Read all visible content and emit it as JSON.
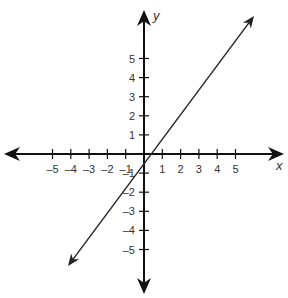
{
  "chart_data": {
    "type": "line",
    "title": "",
    "xlabel": "x",
    "ylabel": "y",
    "xlim": [
      -7,
      7
    ],
    "ylim": [
      -7,
      7
    ],
    "grid": false,
    "x_ticks": [
      -5,
      -4,
      -3,
      -2,
      -1,
      1,
      2,
      3,
      4,
      5
    ],
    "y_ticks": [
      -5,
      -4,
      -3,
      -2,
      -1,
      1,
      2,
      3,
      4,
      5
    ],
    "x_tick_labels": [
      "–5",
      "–4",
      "–3",
      "–2",
      "–1",
      "1",
      "2",
      "3",
      "4",
      "5"
    ],
    "y_tick_labels": [
      "–5",
      "–4",
      "–3",
      "–2",
      "–1",
      "1",
      "2",
      "3",
      "4",
      "5"
    ],
    "series": [
      {
        "name": "line",
        "slope": 1.3333,
        "intercept": -0.3333,
        "points_on_line": [
          [
            -2,
            -3
          ],
          [
            1,
            1
          ]
        ],
        "x": [
          -4,
          6
        ],
        "y": [
          -5.67,
          7.67
        ],
        "arrows_both_ends": true
      }
    ],
    "legend": null
  },
  "layout": {
    "origin_px": [
      144,
      154
    ],
    "x_unit_px": 18.3,
    "y_unit_px": 19.1,
    "x_axis_px": [
      4,
      284
    ],
    "y_axis_px": [
      10,
      294
    ],
    "line_start_px": [
      68,
      266
    ],
    "line_end_px": [
      254,
      16
    ],
    "colors": {
      "axis": "#111111",
      "line": "#222222",
      "text": "#333333"
    }
  }
}
